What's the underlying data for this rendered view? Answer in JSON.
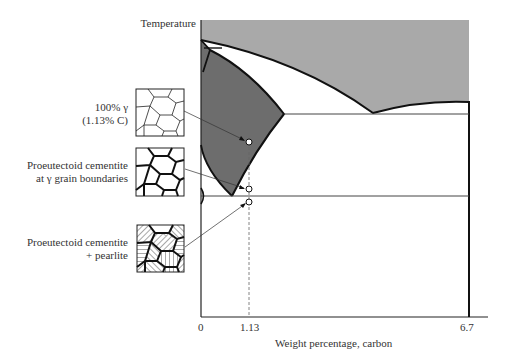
{
  "diagram": {
    "y_axis_label": "Temperature",
    "x_axis_label": "Weight percentage, carbon",
    "x_ticks": [
      "0",
      "1.13",
      "6.7"
    ],
    "colors": {
      "liquid_region": "#a9a9a9",
      "austenite_region": "#6d6d6d",
      "lines": "#111111",
      "background": "#ffffff"
    },
    "microstructures": [
      {
        "id": "austenite",
        "label_line1": "100% γ",
        "label_line2": "(1.13% C)",
        "description": "equiaxed austenite grains, thin boundaries"
      },
      {
        "id": "boundary-cementite",
        "label_line1": "Proeutectoid cementite",
        "label_line2": "at γ grain boundaries",
        "description": "thick dark grain boundaries"
      },
      {
        "id": "pearlite",
        "label_line1": "Proeutectoid cementite",
        "label_line2": "+ pearlite",
        "description": "hatched lamellar grains with thick boundaries"
      }
    ],
    "composition_marker": "1.13"
  }
}
